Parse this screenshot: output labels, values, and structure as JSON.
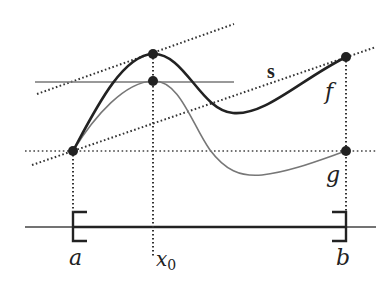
{
  "figure": {
    "colors": {
      "curve_f": "#222222",
      "curve_g": "#777777",
      "tangent_line": "#777777",
      "axis": "#333333",
      "dots": "#222222"
    }
  },
  "labels": {
    "a": "a",
    "b": "b",
    "x0_main": "x",
    "x0_sub": "0",
    "f": "f",
    "g": "g",
    "s": "s"
  },
  "points": [
    {
      "name": "f(a)=g(a)",
      "id": "point-a"
    },
    {
      "name": "f(x0)",
      "id": "point-f-x0"
    },
    {
      "name": "g(x0)",
      "id": "point-g-x0"
    },
    {
      "name": "f(b)",
      "id": "point-f-b"
    },
    {
      "name": "g(b)",
      "id": "point-g-b"
    }
  ]
}
